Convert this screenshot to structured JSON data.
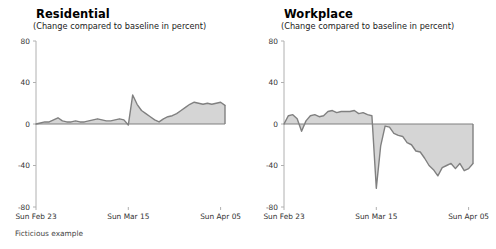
{
  "figure": {
    "footnote": "Ficticious example",
    "background_color": "#ffffff",
    "line_color": "#808080",
    "fill_color": "#d5d5d5",
    "axis_color": "#b0b0b0",
    "tick_text_color": "#333333"
  },
  "panels": [
    {
      "key": "residential",
      "title": "Residential",
      "subtitle": "(Change compared to baseline in percent)"
    },
    {
      "key": "workplace",
      "title": "Workplace",
      "subtitle": "(Change compared to baseline in percent)"
    }
  ],
  "axis": {
    "y_ticks": [
      "80",
      "40",
      "0",
      "-40",
      "-80"
    ],
    "y_values": [
      80,
      40,
      0,
      -40,
      -80
    ],
    "x_ticks": [
      "Sun Feb 23",
      "Sun Mar 15",
      "Sun Apr 05"
    ],
    "x_tick_indices": [
      0,
      21,
      42
    ]
  },
  "chart_data": [
    {
      "type": "area",
      "title": "Residential",
      "subtitle": "(Change compared to baseline in percent)",
      "xlabel": "",
      "ylabel": "Change compared to baseline in percent",
      "ylim": [
        -80,
        80
      ],
      "yticks": [
        -80,
        -40,
        0,
        40,
        80
      ],
      "xticklabels": [
        "Sun Feb 23",
        "Sun Mar 15",
        "Sun Apr 05"
      ],
      "xtickpositions": [
        0,
        21,
        42
      ],
      "grid": false,
      "legend": "none",
      "baseline": 0,
      "x": [
        0,
        1,
        2,
        3,
        4,
        5,
        6,
        7,
        8,
        9,
        10,
        11,
        12,
        13,
        14,
        15,
        16,
        17,
        18,
        19,
        20,
        21,
        22,
        23,
        24,
        25,
        26,
        27,
        28,
        29,
        30,
        31,
        32,
        33,
        34,
        35,
        36,
        37,
        38,
        39,
        40,
        41,
        42,
        43
      ],
      "values": [
        0,
        1,
        2,
        2,
        4,
        6,
        3,
        2,
        2,
        3,
        2,
        2,
        3,
        4,
        5,
        4,
        3,
        3,
        4,
        5,
        4,
        -1,
        28,
        19,
        13,
        10,
        7,
        4,
        2,
        5,
        7,
        8,
        10,
        13,
        16,
        19,
        21,
        20,
        19,
        20,
        19,
        20,
        21,
        18
      ]
    },
    {
      "type": "area",
      "title": "Workplace",
      "subtitle": "(Change compared to baseline in percent)",
      "xlabel": "",
      "ylabel": "Change compared to baseline in percent",
      "ylim": [
        -80,
        80
      ],
      "yticks": [
        -80,
        -40,
        0,
        40,
        80
      ],
      "xticklabels": [
        "Sun Feb 23",
        "Sun Mar 15",
        "Sun Apr 05"
      ],
      "xtickpositions": [
        0,
        21,
        42
      ],
      "grid": false,
      "legend": "none",
      "baseline": 0,
      "x": [
        0,
        1,
        2,
        3,
        4,
        5,
        6,
        7,
        8,
        9,
        10,
        11,
        12,
        13,
        14,
        15,
        16,
        17,
        18,
        19,
        20,
        21,
        22,
        23,
        24,
        25,
        26,
        27,
        28,
        29,
        30,
        31,
        32,
        33,
        34,
        35,
        36,
        37,
        38,
        39,
        40,
        41,
        42,
        43
      ],
      "values": [
        0,
        8,
        9,
        5,
        -7,
        3,
        8,
        9,
        7,
        8,
        12,
        13,
        11,
        12,
        12,
        12,
        13,
        10,
        11,
        9,
        8,
        -62,
        -21,
        -2,
        -3,
        -9,
        -11,
        -12,
        -18,
        -20,
        -26,
        -27,
        -33,
        -40,
        -44,
        -50,
        -42,
        -40,
        -38,
        -43,
        -38,
        -45,
        -43,
        -38
      ]
    }
  ]
}
